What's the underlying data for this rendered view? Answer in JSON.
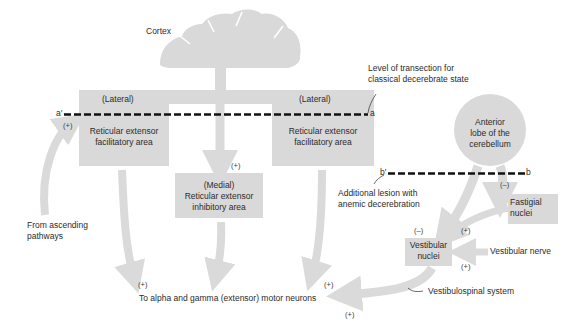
{
  "colors": {
    "fill": "#d9d9d9",
    "arrow": "#dadada",
    "text": "#2b2b2b",
    "lesion_line": "#111111"
  },
  "labels": {
    "cortex": "Cortex",
    "lateral_left": "(Lateral)",
    "lateral_right": "(Lateral)",
    "facilitatory_left": [
      "Reticular extensor",
      "facilitatory area"
    ],
    "facilitatory_right": [
      "Reticular extensor",
      "facilitatory area"
    ],
    "medial": [
      "(Medial)",
      "Reticular extensor",
      "inhibitory area"
    ],
    "cerebellum": [
      "Anterior",
      "lobe of the",
      "cerebellum"
    ],
    "fastigial": [
      "Fastigial",
      "nuclei"
    ],
    "vestibular": [
      "Vestibular",
      "nuclei"
    ],
    "vestibular_nerve": "Vestibular nerve",
    "vestibulospinal": "Vestibulospinal system",
    "ascending": [
      "From ascending",
      "pathways"
    ],
    "motor_neurons": "To alpha and gamma (extensor) motor neurons",
    "transection": [
      "Level of transection for",
      "classical decerebrate state"
    ],
    "additional_lesion": [
      "Additional lesion with",
      "anemic decerebration"
    ],
    "a_prime": "a′",
    "a": "a",
    "b_prime": "b′",
    "b": "b"
  },
  "signs": {
    "ascending_plus": "(+)",
    "medial_plus": "(+)",
    "motor_left_plus": "(+)",
    "motor_right_plus": "(+)",
    "motor_bottom_plus": "(+)",
    "cerebellum_minus": "(–)",
    "vestibular_minus": "(–)",
    "fastigial_plus": "(+)",
    "vestibular_nerve_plus": "(+)"
  }
}
